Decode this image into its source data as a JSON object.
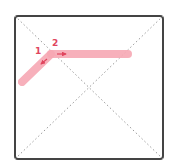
{
  "diagram": {
    "frame": {
      "x": 15,
      "y": 16,
      "width": 148,
      "height": 143,
      "stroke": "#444444",
      "stroke_width": 2,
      "corner_radius": 3
    },
    "diagonal_style": {
      "stroke": "#9a9a9a",
      "dash": "1.5 2.5"
    },
    "strokes": [
      {
        "id": "stroke-1",
        "from": [
          22,
          82
        ],
        "to": [
          51,
          54
        ],
        "color": "#f7a8b4",
        "width": 8
      },
      {
        "id": "stroke-2",
        "from": [
          51,
          54
        ],
        "to": [
          128,
          54
        ],
        "color": "#f7a8b4",
        "width": 8
      }
    ],
    "arrows": [
      {
        "id": "arrow-1",
        "from": [
          47,
          59
        ],
        "to": [
          41,
          64
        ],
        "color": "#e0455e"
      },
      {
        "id": "arrow-2",
        "from": [
          57,
          54
        ],
        "to": [
          66,
          54
        ],
        "color": "#e0455e"
      }
    ],
    "labels": [
      {
        "id": "label-1",
        "text": "1",
        "x": 35,
        "y": 54,
        "color": "#e0455e"
      },
      {
        "id": "label-2",
        "text": "2",
        "x": 52,
        "y": 46,
        "color": "#e0455e"
      }
    ]
  }
}
